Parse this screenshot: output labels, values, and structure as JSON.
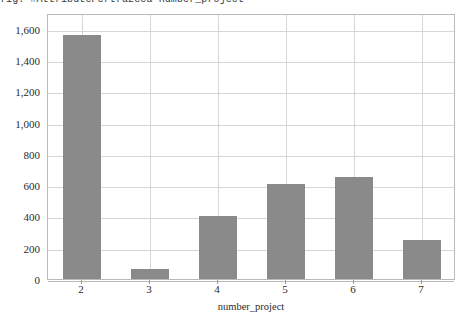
{
  "chart_data": {
    "type": "bar",
    "title": "fig: #AttributePertrazeca  number_project",
    "xlabel": "number_project",
    "ylabel": "",
    "categories": [
      "2",
      "3",
      "4",
      "5",
      "6",
      "7"
    ],
    "values": [
      1560,
      65,
      400,
      610,
      650,
      250
    ],
    "series": [
      {
        "name": "count",
        "values": [
          1560,
          65,
          400,
          610,
          650,
          250
        ]
      }
    ],
    "ylim": [
      0,
      1700
    ],
    "y_ticks": [
      0,
      200,
      400,
      600,
      800,
      1000,
      1200,
      1400,
      1600
    ],
    "y_tick_labels": [
      "0",
      "200",
      "400",
      "600",
      "800",
      "1,000",
      "1,200",
      "1,400",
      "1,600"
    ],
    "x_tick_labels": [
      "2",
      "3",
      "4",
      "5",
      "6",
      "7"
    ],
    "grid": true,
    "legend": false,
    "bar_color": "#8a8a8a",
    "grid_color": "#d6d6d6",
    "frame_color": "#b9b9b9",
    "text_color": "#2b2b2b"
  }
}
